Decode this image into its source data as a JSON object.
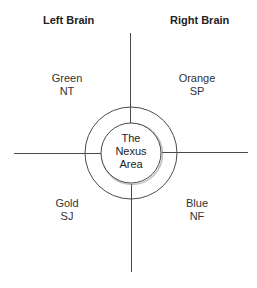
{
  "headings": {
    "left": "Left Brain",
    "right": "Right Brain"
  },
  "quadrants": [
    {
      "position": "top-left",
      "color_name": "Green",
      "type_code": "NT"
    },
    {
      "position": "top-right",
      "color_name": "Orange",
      "type_code": "SP"
    },
    {
      "position": "bottom-left",
      "color_name": "Gold",
      "type_code": "SJ"
    },
    {
      "position": "bottom-right",
      "color_name": "Blue",
      "type_code": "NF"
    }
  ],
  "center": {
    "line1": "The",
    "line2": "Nexus",
    "line3": "Area"
  },
  "colors": {
    "line": "#4a4a4a",
    "text": "#2a2a2a",
    "background": "#ffffff"
  }
}
